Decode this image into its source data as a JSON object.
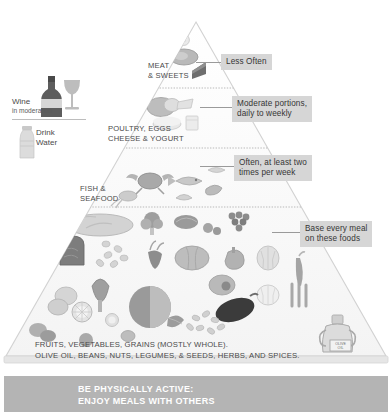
{
  "colors": {
    "callout_bg": "#d6d6d6",
    "callout_text": "#353535",
    "footer_bg": "#b4b4b4",
    "footer_text": "#ffffff",
    "pyramid_fill": "#fbfbfb",
    "pyramid_edge": "#cfcfcf",
    "label_text": "#4a4a4a"
  },
  "pyramid": {
    "tiers": [
      {
        "id": "meat-sweets",
        "label": "MEAT\n& SWEETS",
        "callout": "Less Often",
        "foods": [
          "cake-slice-icon",
          "steak-icon",
          "candy-icon"
        ]
      },
      {
        "id": "poultry-eggs-cheese-yogurt",
        "label": "POULTRY, EGGS\nCHEESE & YOGURT",
        "callout": "Moderate portions,\ndaily to weekly",
        "foods": [
          "eggs-icon",
          "cheese-wedge-icon",
          "chicken-icon",
          "yogurt-icon"
        ]
      },
      {
        "id": "fish-seafood",
        "label": "FISH &\nSEAFOOD",
        "callout": "Often, at least two\ntimes per week",
        "foods": [
          "crab-icon",
          "fish-icon",
          "shrimp-icon",
          "squid-icon",
          "shellfish-icon"
        ]
      },
      {
        "id": "base-foods",
        "label": "FRUITS, VEGETABLES, GRAINS (MOSTLY WHOLE).\nOLIVE OIL, BEANS, NUTS, LEGUMES, & SEEDS, HERBS, AND SPICES.",
        "callout": "Base every meal\non these foods",
        "foods": [
          "bread-loaf-icon",
          "bread-slice-icon",
          "pasta-icon",
          "beet-icon",
          "pumpkin-icon",
          "artichoke-icon",
          "lemon-icon",
          "lemon-slice-icon",
          "onion-icon",
          "asparagus-icon",
          "eggplant-icon",
          "grapes-icon",
          "garlic-icon",
          "bell-pepper-icon",
          "tomato-icon",
          "avocado-icon",
          "chili-pepper-icon",
          "beans-icon",
          "olive-oil-jug-icon",
          "mushroom-icon",
          "broccoli-icon",
          "leafy-greens-icon",
          "cherries-icon"
        ]
      }
    ]
  },
  "beverages": [
    {
      "id": "wine",
      "label": "Wine",
      "sublabel": "in moderation",
      "icons": [
        "wine-bottle-icon",
        "wine-glass-icon"
      ]
    },
    {
      "id": "water",
      "label": "Drink\nWater",
      "icons": [
        "water-bottle-icon"
      ]
    }
  ],
  "footer": {
    "text": "BE PHYSICALLY ACTIVE:\nENJOY MEALS WITH OTHERS",
    "icons": [
      "cyclist-icon",
      "runner-icon"
    ]
  }
}
